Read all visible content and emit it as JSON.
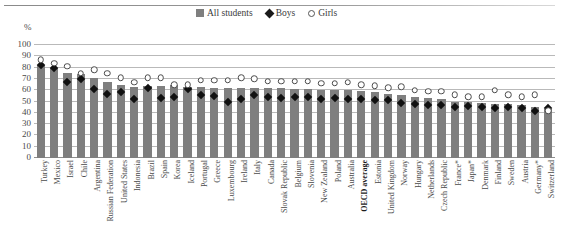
{
  "legend": {
    "items": [
      {
        "label": "All students",
        "marker": "bar-swatch-icon",
        "color": "#7f7f7f"
      },
      {
        "label": "Boys",
        "marker": "diamond-icon",
        "color": "#111111"
      },
      {
        "label": "Girls",
        "marker": "circle-outline-icon",
        "color": "#ffffff"
      }
    ]
  },
  "axis": {
    "unit_label": "%",
    "y_ticks": [
      "0",
      "10",
      "20",
      "30",
      "40",
      "50",
      "60",
      "70",
      "80",
      "90",
      "100"
    ]
  },
  "chart_data": {
    "type": "bar",
    "title": "",
    "xlabel": "",
    "ylabel": "%",
    "ylim": [
      0,
      100
    ],
    "ytick_step": 10,
    "grid": true,
    "legend_position": "top-center",
    "categories": [
      "Turkey",
      "Mexico",
      "Israel",
      "Chile",
      "Argentina",
      "Russian Federation",
      "United States",
      "Indonesia",
      "Brazil",
      "Spain",
      "Korea",
      "Iceland",
      "Portugal",
      "Greece",
      "Luxembourg",
      "Ireland",
      "Italy",
      "Canada",
      "Slovak Republic",
      "Belgium",
      "Slovenia",
      "New Zealand",
      "Poland",
      "Australia",
      "OECD average",
      "Estonia",
      "United Kingdom",
      "Norway",
      "Hungary",
      "Netherlands",
      "Czech Republic",
      "France*",
      "Japan*",
      "Denmark",
      "Finland",
      "Sweden",
      "Austria",
      "Germany*",
      "Switzerland"
    ],
    "emphasis_category": "OECD average",
    "footnote_marker": "*",
    "series": [
      {
        "name": "All students",
        "type": "bar",
        "color": "#7f7f7f",
        "values": [
          82,
          80,
          75,
          74,
          71,
          67,
          65,
          63,
          64,
          64,
          65,
          63,
          63,
          62,
          62,
          62,
          62,
          62,
          62,
          61,
          61,
          60,
          60,
          60,
          59,
          58,
          57,
          56,
          54,
          53,
          52,
          50,
          50,
          49,
          48,
          48,
          47,
          45,
          43
        ]
      },
      {
        "name": "Boys",
        "type": "marker-diamond",
        "color": "#111111",
        "values": [
          82,
          80,
          67,
          70,
          61,
          57,
          58,
          52,
          62,
          53,
          54,
          61,
          56,
          55,
          50,
          52,
          56,
          54,
          53,
          54,
          54,
          52,
          53,
          52,
          52,
          51,
          51,
          49,
          48,
          47,
          47,
          45,
          46,
          45,
          44,
          45,
          44,
          42,
          44
        ]
      },
      {
        "name": "Girls",
        "type": "marker-circle",
        "color": "#ffffff",
        "values": [
          87,
          84,
          81,
          75,
          78,
          75,
          71,
          67,
          71,
          71,
          65,
          65,
          69,
          69,
          69,
          71,
          70,
          68,
          68,
          68,
          68,
          66,
          66,
          67,
          65,
          64,
          62,
          63,
          60,
          59,
          59,
          56,
          54,
          54,
          60,
          56,
          54,
          56,
          42
        ]
      }
    ]
  }
}
